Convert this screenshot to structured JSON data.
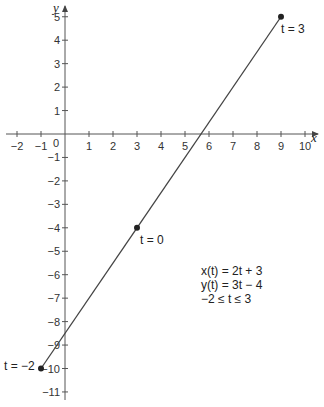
{
  "chart_data": {
    "type": "line",
    "title": "",
    "xlabel": "x",
    "ylabel": "y",
    "xlim": [
      -2,
      10
    ],
    "ylim": [
      -11,
      5
    ],
    "x_ticks": [
      -2,
      -1,
      0,
      1,
      2,
      3,
      4,
      5,
      6,
      7,
      8,
      9,
      10
    ],
    "y_ticks": [
      5,
      4,
      3,
      2,
      1,
      -1,
      -2,
      -3,
      -4,
      -5,
      -6,
      -7,
      -8,
      -9,
      -10,
      -11
    ],
    "grid": false,
    "series": [
      {
        "name": "parametric line",
        "x": [
          -1,
          3,
          9
        ],
        "y": [
          -10,
          -4,
          5
        ]
      }
    ],
    "points": [
      {
        "label": "t = −2",
        "x": -1,
        "y": -10
      },
      {
        "label": "t = 0",
        "x": 3,
        "y": -4
      },
      {
        "label": "t = 3",
        "x": 9,
        "y": 5
      }
    ],
    "annotations": [
      "x(t) = 2t + 3",
      "y(t) = 3t − 4",
      "−2 ≤ t ≤ 3"
    ]
  },
  "labels": {
    "x_axis": "x",
    "y_axis": "y",
    "origin": "0",
    "eq1": "x(t) = 2t + 3",
    "eq2": "y(t) = 3t − 4",
    "eq3": "−2 ≤ t ≤ 3",
    "pt_start": "t = −2",
    "pt_mid": "t = 0",
    "pt_end": "t = 3"
  },
  "colors": {
    "line": "#444444",
    "axis": "#555555"
  }
}
